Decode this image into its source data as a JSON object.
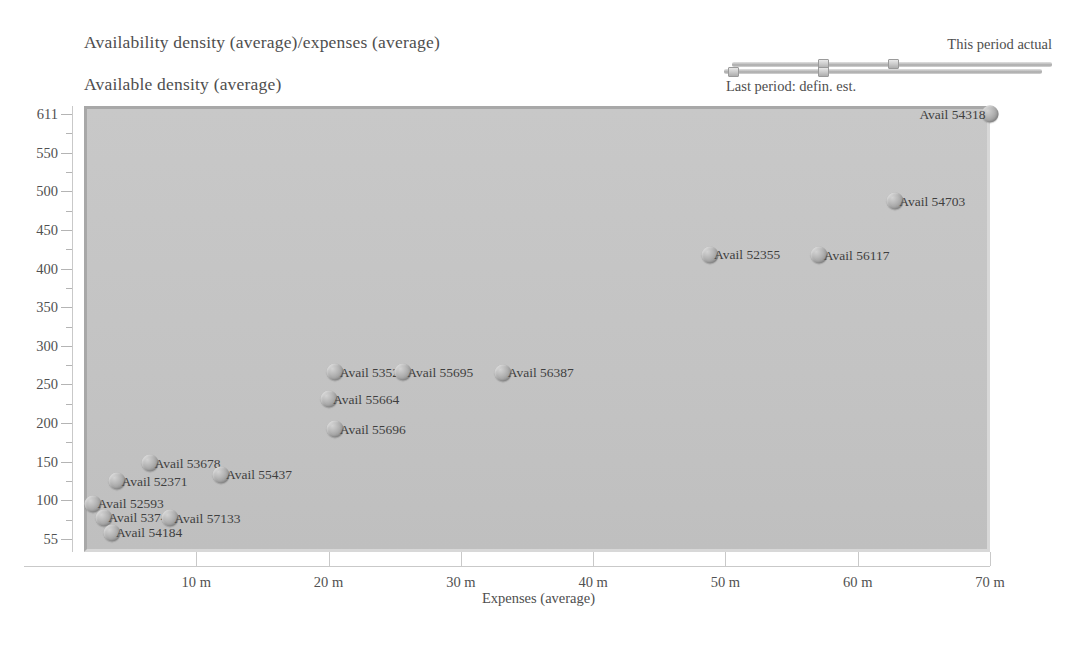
{
  "titles": {
    "main": "Availability density (average)/expenses (average)",
    "sub": "Available density (average)"
  },
  "legend": {
    "top_label": "This period actual",
    "bottom_label": "Last period: defin. est."
  },
  "chart_data": {
    "type": "scatter",
    "title": "Availability density (average)/expenses (average)",
    "subtitle": "Available density (average)",
    "xlabel": "Expenses (average)",
    "ylabel": "Available density (average)",
    "grid": false,
    "legend_position": "top-right",
    "legend_entries": [
      "This period actual",
      "Last period: defin. est."
    ],
    "xlim": [
      0,
      70
    ],
    "ylim": [
      55,
      611
    ],
    "xticks": [
      10,
      20,
      30,
      40,
      50,
      60,
      70
    ],
    "xticklabels": [
      "10 m",
      "20 m",
      "30 m",
      "40 m",
      "50 m",
      "60 m",
      "70 m"
    ],
    "yticks": [
      55,
      100,
      150,
      200,
      250,
      300,
      350,
      400,
      450,
      500,
      550,
      611
    ],
    "yticklabels": [
      "55",
      "100",
      "150",
      "200",
      "250",
      "300",
      "350",
      "400",
      "450",
      "500",
      "550",
      "611"
    ],
    "point_labels": [
      "Avail 54318",
      "Avail 54703",
      "Avail 52355",
      "Avail 56117",
      "Avail 53525",
      "Avail 55695",
      "Avail 56387",
      "Avail 55664",
      "Avail 55696",
      "Avail 53678",
      "Avail 55437",
      "Avail 52371",
      "Avail 52593",
      "Avail 53747",
      "Avail 57133",
      "Avail 54184"
    ],
    "points": [
      {
        "label": "Avail 54318",
        "x": 70.0,
        "y": 611,
        "label_side": "left"
      },
      {
        "label": "Avail 54703",
        "x": 62.8,
        "y": 487,
        "label_side": "right"
      },
      {
        "label": "Avail 52355",
        "x": 48.8,
        "y": 418,
        "label_side": "right"
      },
      {
        "label": "Avail 56117",
        "x": 57.1,
        "y": 417,
        "label_side": "right"
      },
      {
        "label": "Avail 53525",
        "x": 20.5,
        "y": 266,
        "label_side": "right"
      },
      {
        "label": "Avail 55695",
        "x": 25.6,
        "y": 266,
        "label_side": "right"
      },
      {
        "label": "Avail 56387",
        "x": 33.2,
        "y": 265,
        "label_side": "right"
      },
      {
        "label": "Avail 55664",
        "x": 20.0,
        "y": 231,
        "label_side": "right"
      },
      {
        "label": "Avail 55696",
        "x": 20.5,
        "y": 192,
        "label_side": "right"
      },
      {
        "label": "Avail 53678",
        "x": 6.5,
        "y": 148,
        "label_side": "right"
      },
      {
        "label": "Avail 55437",
        "x": 11.9,
        "y": 133,
        "label_side": "right"
      },
      {
        "label": "Avail 52371",
        "x": 4.0,
        "y": 125,
        "label_side": "right"
      },
      {
        "label": "Avail 52593",
        "x": 2.2,
        "y": 96,
        "label_side": "right"
      },
      {
        "label": "Avail 53747",
        "x": 3.0,
        "y": 80,
        "label_side": "right"
      },
      {
        "label": "Avail 57133",
        "x": 8.0,
        "y": 79,
        "label_side": "right"
      },
      {
        "label": "Avail 54184",
        "x": 3.6,
        "y": 62,
        "label_side": "right"
      }
    ]
  }
}
